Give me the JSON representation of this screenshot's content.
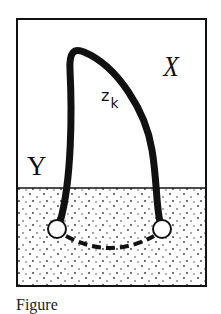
{
  "figure": {
    "region_upper_label": "X",
    "region_lower_label": "Y",
    "curve_label": "z",
    "curve_label_subscript": "k",
    "caption": "Figure"
  },
  "colors": {
    "line": "#111111",
    "background": "#ffffff",
    "stipple": "#333333"
  }
}
